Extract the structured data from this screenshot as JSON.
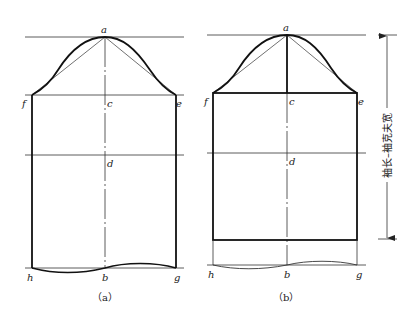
{
  "figure": {
    "panels": [
      {
        "id": "a",
        "caption": "（a）",
        "points": {
          "a": "a",
          "c": "c",
          "d": "d",
          "e": "e",
          "f": "f",
          "h": "h",
          "b": "b",
          "g": "g"
        }
      },
      {
        "id": "b",
        "caption": "（b）",
        "points": {
          "a": "a",
          "c": "c",
          "d": "d",
          "e": "e",
          "f": "f",
          "h": "h",
          "b": "b",
          "g": "g"
        }
      }
    ],
    "dimension_label": "袖长–袖克夫宽"
  }
}
